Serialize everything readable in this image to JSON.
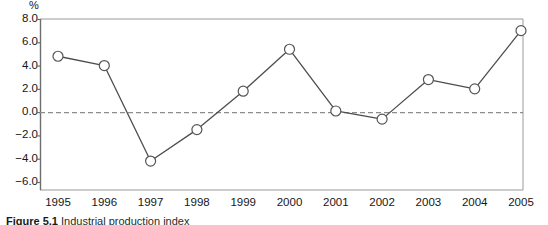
{
  "figure": {
    "caption_label": "Figure 5.1",
    "caption_text": "Industrial production index",
    "y_unit": "%"
  },
  "chart_data": {
    "type": "line",
    "title": "",
    "xlabel": "",
    "ylabel": "%",
    "categories": [
      "1995",
      "1996",
      "1997",
      "1998",
      "1999",
      "2000",
      "2001",
      "2002",
      "2003",
      "2004",
      "2005"
    ],
    "values": [
      4.8,
      4.0,
      -4.2,
      -1.5,
      1.8,
      5.4,
      0.1,
      -0.6,
      2.8,
      2.0,
      7.0
    ],
    "ylim": [
      -6.0,
      8.0
    ],
    "ytick_labels": [
      "8.0",
      "6.0",
      "4.0",
      "2.0",
      "0.0",
      "-2.0",
      "-4.0",
      "-6.0"
    ],
    "ytick_values": [
      8.0,
      6.0,
      4.0,
      2.0,
      0.0,
      -2.0,
      -4.0,
      -6.0
    ],
    "grid": false,
    "legend": "none",
    "zero_line": true,
    "marker": "open-circle",
    "colors": {
      "line": "#4d4d4d",
      "marker_fill": "#ffffff",
      "marker_stroke": "#555555",
      "axis": "#6e6e6e",
      "zero_line": "#8c8c8c",
      "frame": "#9a9a9a",
      "text": "#161616"
    }
  }
}
